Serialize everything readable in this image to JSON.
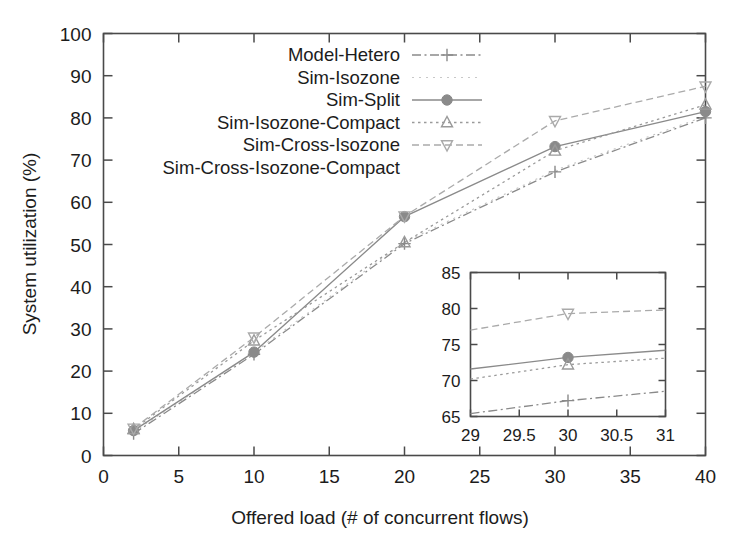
{
  "figure": {
    "background": "#ffffff",
    "axis_color": "#4a4a4a",
    "text_color": "#1c1c1c"
  },
  "chart_data": {
    "type": "line",
    "title": "",
    "xlabel": "Offered load (# of concurrent flows)",
    "ylabel": "System utilization (%)",
    "xlim": [
      0,
      40
    ],
    "ylim": [
      0,
      100
    ],
    "xticks": [
      0,
      5,
      10,
      15,
      20,
      25,
      30,
      35,
      40
    ],
    "yticks": [
      0,
      10,
      20,
      30,
      40,
      50,
      60,
      70,
      80,
      90,
      100
    ],
    "xtick_labels": [
      "0",
      "5",
      "10",
      "15",
      "20",
      "25",
      "30",
      "35",
      "40"
    ],
    "ytick_labels": [
      "0",
      "10",
      "20",
      "30",
      "40",
      "50",
      "60",
      "70",
      "80",
      "90",
      "100"
    ],
    "grid": false,
    "legend_position": "top-center",
    "x": [
      2,
      10,
      20,
      30,
      40
    ],
    "series": [
      {
        "name": "Model-Hetero",
        "marker": "plus",
        "linestyle": "dash-dot",
        "color": "#8a8a8a",
        "values": [
          5.2,
          24.0,
          50.2,
          67.2,
          80.0
        ]
      },
      {
        "name": "Sim-Isozone",
        "marker": "none",
        "linestyle": "dotted-faint",
        "color": "#c2c2c2",
        "values": [
          5.6,
          24.4,
          50.6,
          67.6,
          80.4
        ]
      },
      {
        "name": "Sim-Split",
        "marker": "filled-circle",
        "linestyle": "solid",
        "color": "#8a8a8a",
        "values": [
          5.9,
          24.5,
          56.6,
          73.2,
          81.5
        ]
      },
      {
        "name": "Sim-Isozone-Compact",
        "marker": "triangle-up",
        "linestyle": "dotted",
        "color": "#9a9a9a",
        "values": [
          6.2,
          27.2,
          50.5,
          72.2,
          83.1
        ]
      },
      {
        "name": "Sim-Cross-Isozone",
        "marker": "triangle-down",
        "linestyle": "dashed",
        "color": "#aaaaaa",
        "values": [
          6.4,
          28.0,
          56.7,
          79.3,
          87.5
        ]
      },
      {
        "name": "Sim-Cross-Isozone-Compact",
        "marker": "none",
        "linestyle": "none",
        "color": "#cccccc",
        "values": [
          6.4,
          28.0,
          56.7,
          79.3,
          87.5
        ]
      }
    ],
    "inset": {
      "xlim": [
        29,
        31
      ],
      "ylim": [
        65,
        85
      ],
      "xticks": [
        29,
        29.5,
        30,
        30.5,
        31
      ],
      "yticks": [
        65,
        70,
        75,
        80,
        85
      ],
      "xtick_labels": [
        "29",
        "29.5",
        "30",
        "30.5",
        "31"
      ],
      "ytick_labels": [
        "65",
        "70",
        "75",
        "80",
        "85"
      ],
      "x": [
        29,
        30,
        31
      ],
      "series": [
        {
          "name": "Model-Hetero",
          "marker": "plus",
          "linestyle": "dash-dot",
          "color": "#8a8a8a",
          "values": [
            65.4,
            67.2,
            68.5
          ]
        },
        {
          "name": "Sim-Split",
          "marker": "filled-circle",
          "linestyle": "solid",
          "color": "#8a8a8a",
          "values": [
            71.6,
            73.2,
            74.2
          ]
        },
        {
          "name": "Sim-Isozone-Compact",
          "marker": "triangle-up",
          "linestyle": "dotted",
          "color": "#9a9a9a",
          "values": [
            70.2,
            72.2,
            73.1
          ]
        },
        {
          "name": "Sim-Cross-Isozone",
          "marker": "triangle-down",
          "linestyle": "dashed",
          "color": "#aaaaaa",
          "values": [
            77.0,
            79.3,
            79.8
          ]
        }
      ]
    }
  },
  "legend": {
    "entries": [
      {
        "label": "Model-Hetero",
        "marker": "plus",
        "linestyle": "dash-dot",
        "color": "#8a8a8a"
      },
      {
        "label": "Sim-Isozone",
        "marker": "none",
        "linestyle": "dotted-faint",
        "color": "#c8c8c8"
      },
      {
        "label": "Sim-Split",
        "marker": "filled-circle",
        "linestyle": "solid",
        "color": "#8a8a8a"
      },
      {
        "label": "Sim-Isozone-Compact",
        "marker": "triangle-up",
        "linestyle": "dotted",
        "color": "#9a9a9a"
      },
      {
        "label": "Sim-Cross-Isozone",
        "marker": "triangle-down",
        "linestyle": "dashed",
        "color": "#aaaaaa"
      },
      {
        "label": "Sim-Cross-Isozone-Compact",
        "marker": "none",
        "linestyle": "none",
        "color": "#cccccc"
      }
    ]
  }
}
